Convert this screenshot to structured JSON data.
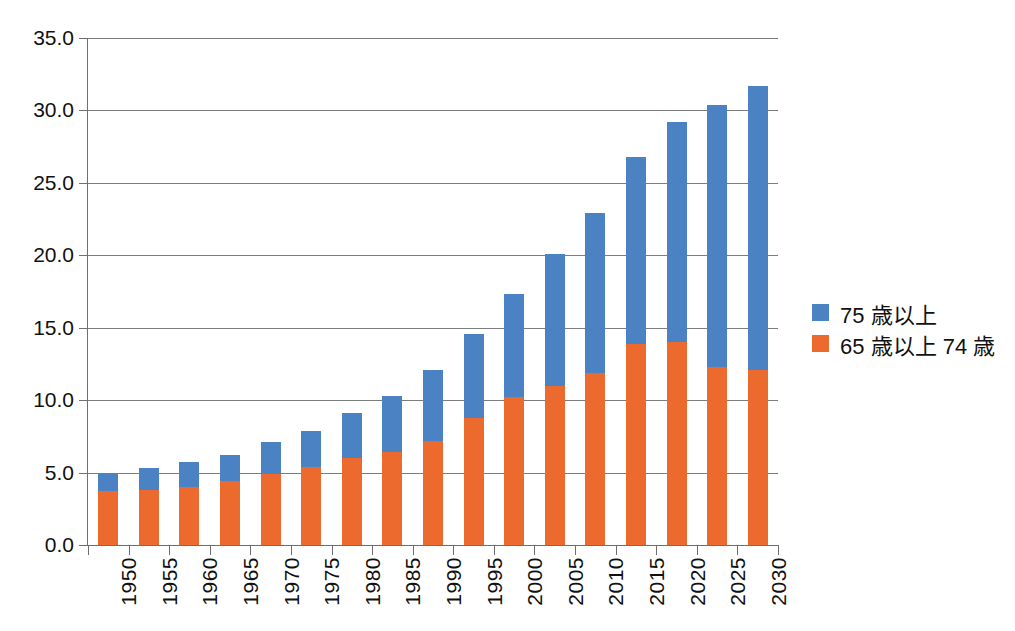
{
  "chart_data": {
    "type": "bar",
    "stacked": true,
    "title": "",
    "xlabel": "",
    "ylabel": "",
    "ylim": [
      0,
      35
    ],
    "ytick_step": 5,
    "ytick_labels": [
      "0.0",
      "5.0",
      "10.0",
      "15.0",
      "20.0",
      "25.0",
      "30.0",
      "35.0"
    ],
    "grid": true,
    "legend_position": "right",
    "categories": [
      "1950",
      "1955",
      "1960",
      "1965",
      "1970",
      "1975",
      "1980",
      "1985",
      "1990",
      "1995",
      "2000",
      "2005",
      "2010",
      "2015",
      "2020",
      "2025",
      "2030"
    ],
    "series": [
      {
        "name": "65 歳以上 74 歳",
        "color": "#ED6A2E",
        "values": [
          3.7,
          3.8,
          4.0,
          4.4,
          4.9,
          5.4,
          6.0,
          6.4,
          7.2,
          8.8,
          10.2,
          11.0,
          11.9,
          13.9,
          14.0,
          12.3,
          12.1
        ]
      },
      {
        "name": "75 歳以上",
        "color": "#4A82C4",
        "values": [
          1.3,
          1.5,
          1.7,
          1.8,
          2.2,
          2.5,
          3.1,
          3.9,
          4.9,
          5.8,
          7.1,
          9.1,
          11.0,
          12.9,
          15.2,
          18.1,
          19.6
        ]
      }
    ],
    "totals": [
      5.0,
      5.3,
      5.7,
      6.2,
      7.1,
      7.9,
      9.1,
      10.3,
      12.1,
      14.6,
      17.3,
      20.1,
      22.9,
      26.8,
      29.2,
      30.4,
      31.7
    ]
  },
  "legend": {
    "items": [
      {
        "label": "75 歳以上",
        "color": "#4A82C4",
        "swatch_name": "legend-swatch-75-and-over"
      },
      {
        "label": "65 歳以上 74 歳",
        "color": "#ED6A2E",
        "swatch_name": "legend-swatch-65-to-74"
      }
    ]
  }
}
